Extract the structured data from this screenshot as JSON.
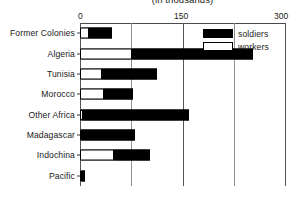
{
  "chart_data": {
    "type": "bar",
    "orientation": "horizontal",
    "stacked": true,
    "title": "(in thousands)",
    "xlabel": "",
    "ylabel": "",
    "xlim": [
      0,
      300
    ],
    "xticks": [
      0,
      150,
      300
    ],
    "xtick_labels": [
      "0",
      "150",
      "300"
    ],
    "gridlines": [
      0,
      75,
      150,
      225,
      300
    ],
    "grid": true,
    "legend_position": "top-right",
    "categories": [
      "Former  Colonies",
      "Algeria",
      "Tunisia",
      "Morocco",
      "Other Africa",
      "Madagascar",
      "Indochina",
      "Pacific"
    ],
    "series": [
      {
        "name": "workers",
        "color": "#ffffff",
        "values": [
          13,
          76,
          32,
          35,
          4,
          3,
          50,
          2
        ]
      },
      {
        "name": "soldiers",
        "color": "#000000",
        "values": [
          34,
          177,
          80,
          42,
          156,
          77,
          52,
          6
        ]
      }
    ],
    "totals": [
      47,
      253,
      112,
      77,
      160,
      80,
      102,
      8
    ]
  },
  "legend": {
    "items": [
      {
        "label": "soldiers",
        "swatch": "filled"
      },
      {
        "label": "workers",
        "swatch": "hollow"
      }
    ]
  },
  "axis": {
    "tick_0": "0",
    "tick_150": "150",
    "tick_300": "300"
  }
}
